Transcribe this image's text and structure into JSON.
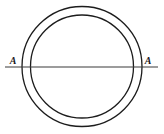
{
  "figure": {
    "name": "concentric-circles-with-axis",
    "canvas": {
      "width": 164,
      "height": 134
    },
    "background_color": "#ffffff",
    "stroke_color": "#1c1c1c",
    "labels": {
      "left_axis_label": "A",
      "right_axis_label": "A"
    }
  },
  "chart_data": {
    "type": "diagram",
    "title": "",
    "subtitle": "",
    "xlabel": "",
    "ylabel": "",
    "elements": [
      {
        "id": "outer-circle",
        "shape": "circle",
        "center_x": 82,
        "center_y": 66.5,
        "radius": 60,
        "stroke": "#1c1c1c",
        "stroke_width": 1.3,
        "fill": "none"
      },
      {
        "id": "inner-circle",
        "shape": "circle",
        "center_x": 82,
        "center_y": 66.5,
        "radius": 51.5,
        "stroke": "#1c1c1c",
        "stroke_width": 1.3,
        "fill": "none"
      },
      {
        "id": "axis-line",
        "shape": "line",
        "x1": 5,
        "y1": 67,
        "x2": 158,
        "y2": 67,
        "stroke": "#3a3a3a",
        "stroke_width": 1.1
      }
    ],
    "annotations": [
      {
        "id": "label-left",
        "text": "A",
        "x": 13,
        "y": 64,
        "style": "italic-serif"
      },
      {
        "id": "label-right",
        "text": "A",
        "x": 148,
        "y": 64,
        "style": "italic-serif"
      }
    ]
  }
}
